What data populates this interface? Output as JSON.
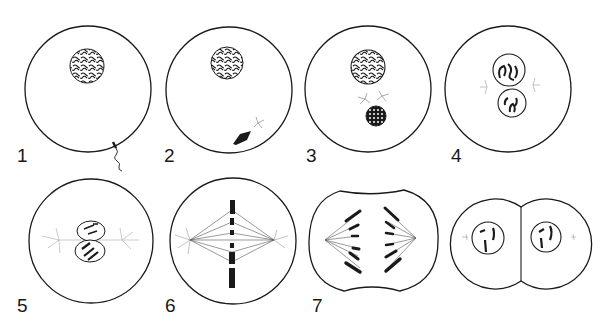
{
  "figure": {
    "panels": [
      {
        "id": 1,
        "label": "1",
        "description": "Egg cell with nucleus; sperm entering at lower right"
      },
      {
        "id": 2,
        "label": "2",
        "description": "Sperm head inside egg with centrosome"
      },
      {
        "id": 3,
        "label": "3",
        "description": "Egg and sperm pronuclei approaching; centrosome divided"
      },
      {
        "id": 4,
        "label": "4",
        "description": "Pronuclei in contact; chromosomes condensing; asters at sides"
      },
      {
        "id": 5,
        "label": "5",
        "description": "Spindle forming between asters; chromosomes visible"
      },
      {
        "id": 6,
        "label": "6",
        "description": "Metaphase: chromosomes on equatorial plate, spindle fibres"
      },
      {
        "id": 7,
        "label": "7",
        "description": "Anaphase: chromosomes moving to poles; cell constricting"
      },
      {
        "id": 8,
        "label": "",
        "description": "Two daughter cells each with nucleus"
      }
    ],
    "colors": {
      "stroke": "#1a1a1a",
      "fill": "#ffffff",
      "aster": "#888888"
    }
  }
}
